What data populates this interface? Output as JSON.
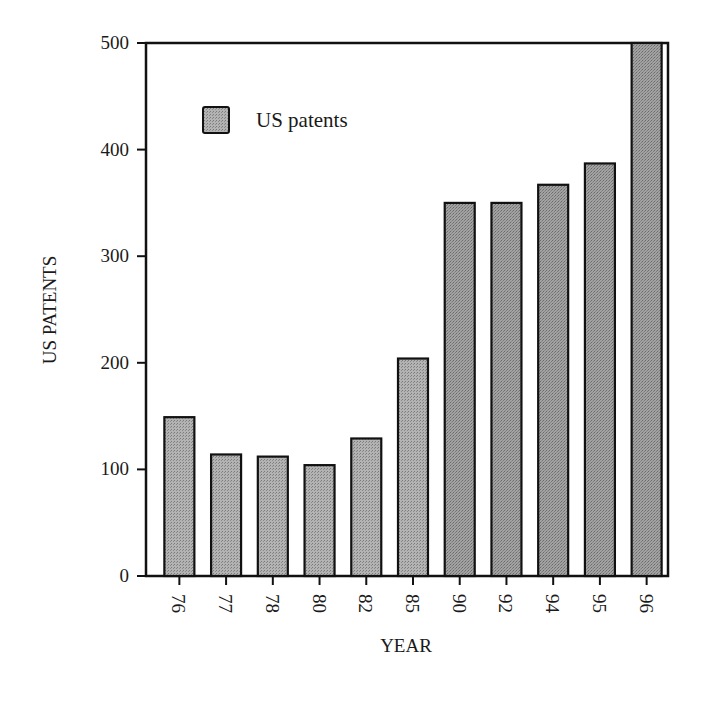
{
  "chart_data": {
    "type": "bar",
    "title": "",
    "xlabel": "YEAR",
    "ylabel": "US PATENTS",
    "categories": [
      "76",
      "77",
      "78",
      "80",
      "82",
      "85",
      "90",
      "92",
      "94",
      "95",
      "96"
    ],
    "series": [
      {
        "name": "US patents",
        "values": [
          149,
          114,
          112,
          104,
          129,
          204,
          350,
          350,
          367,
          387,
          500
        ]
      }
    ],
    "ylim": [
      0,
      500
    ],
    "yticks": [
      0,
      100,
      200,
      300,
      400,
      500
    ],
    "grid": false,
    "legend_position": "upper-left inside plot",
    "colors": {
      "bar_fill": "#a8a8a8",
      "bar_fill_dark": "#8f8f8f",
      "edge": "#111111"
    }
  }
}
